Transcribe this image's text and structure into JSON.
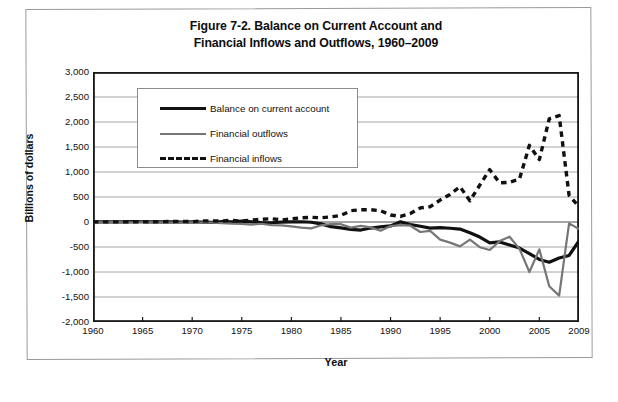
{
  "figure": {
    "title_line1": "Figure 7-2. Balance on Current Account and",
    "title_line2": "Financial Inflows and Outflows, 1960–2009"
  },
  "chart_data": {
    "type": "line",
    "title": "Figure 7-2. Balance on Current Account and Financial Inflows and Outflows, 1960–2009",
    "xlabel": "Year",
    "ylabel": "Billions of dollars",
    "xlim": [
      1960,
      2009
    ],
    "ylim": [
      -2000,
      3000
    ],
    "ytick_labels": [
      "3,000",
      "2,500",
      "2,000",
      "1,500",
      "1,000",
      "500",
      "0",
      "-500",
      "-1,000",
      "-1,500",
      "-2,000"
    ],
    "yticks": [
      3000,
      2500,
      2000,
      1500,
      1000,
      500,
      0,
      -500,
      -1000,
      -1500,
      -2000
    ],
    "xtick_labels": [
      "1960",
      "1965",
      "1970",
      "1975",
      "1980",
      "1985",
      "1990",
      "1995",
      "2000",
      "2005",
      "2009"
    ],
    "xticks": [
      1960,
      1965,
      1970,
      1975,
      1980,
      1985,
      1990,
      1995,
      2000,
      2005,
      2009
    ],
    "grid": true,
    "grid_axis": "y",
    "legend_position": "upper-left-inside",
    "x": [
      1960,
      1961,
      1962,
      1963,
      1964,
      1965,
      1966,
      1967,
      1968,
      1969,
      1970,
      1971,
      1972,
      1973,
      1974,
      1975,
      1976,
      1977,
      1978,
      1979,
      1980,
      1981,
      1982,
      1983,
      1984,
      1985,
      1986,
      1987,
      1988,
      1989,
      1990,
      1991,
      1992,
      1993,
      1994,
      1995,
      1996,
      1997,
      1998,
      1999,
      2000,
      2001,
      2002,
      2003,
      2004,
      2005,
      2006,
      2007,
      2008,
      2009
    ],
    "series": [
      {
        "name": "Balance on current account",
        "style": "solid",
        "color": "#111111",
        "width": 3.2,
        "values": [
          3,
          4,
          3,
          4,
          7,
          5,
          3,
          3,
          1,
          0,
          2,
          -1,
          -6,
          7,
          2,
          18,
          4,
          -14,
          -15,
          -1,
          2,
          5,
          -5,
          -38,
          -94,
          -118,
          -147,
          -161,
          -121,
          -99,
          -79,
          3,
          -50,
          -85,
          -122,
          -114,
          -125,
          -141,
          -215,
          -301,
          -417,
          -399,
          -459,
          -522,
          -631,
          -749,
          -804,
          -719,
          -669,
          -378
        ]
      },
      {
        "name": "Financial outflows",
        "style": "solid",
        "color": "#767676",
        "width": 2.2,
        "values": [
          -4,
          -5,
          -4,
          -7,
          -7,
          -5,
          -6,
          -9,
          -11,
          -11,
          -9,
          -12,
          -14,
          -22,
          -34,
          -39,
          -51,
          -35,
          -61,
          -66,
          -86,
          -114,
          -127,
          -66,
          -40,
          -44,
          -112,
          -79,
          -107,
          -175,
          -81,
          -64,
          -74,
          -200,
          -178,
          -353,
          -413,
          -488,
          -353,
          -504,
          -560,
          -382,
          -294,
          -537,
          -1000,
          -547,
          -1285,
          -1472,
          -27,
          -140
        ]
      },
      {
        "name": "Financial inflows",
        "style": "dashed",
        "color": "#111111",
        "width": 3.4,
        "values": [
          2,
          3,
          2,
          3,
          4,
          2,
          5,
          8,
          10,
          13,
          7,
          22,
          22,
          18,
          35,
          17,
          38,
          54,
          67,
          40,
          62,
          84,
          94,
          85,
          103,
          131,
          226,
          244,
          246,
          225,
          141,
          111,
          170,
          282,
          306,
          438,
          551,
          707,
          424,
          740,
          1047,
          783,
          795,
          858,
          1533,
          1247,
          2065,
          2129,
          534,
          305
        ]
      }
    ]
  },
  "legend": {
    "items": [
      {
        "label": "Balance on current account",
        "swatch": "solid-black-line"
      },
      {
        "label": "Financial outflows",
        "swatch": "solid-gray-line"
      },
      {
        "label": "Financial inflows",
        "swatch": "dashed-black-line"
      }
    ]
  }
}
